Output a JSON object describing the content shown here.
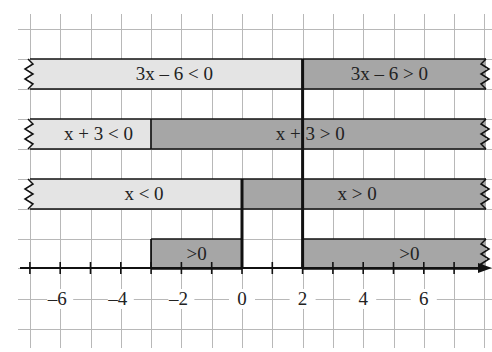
{
  "diagram": {
    "colors": {
      "negative_fill": "#e4e4e4",
      "positive_fill": "#a6a6a6",
      "grid": "#b8b8b8",
      "axis": "#111111",
      "text": "#222222"
    },
    "axis": {
      "tick_labels": [
        "-6",
        "-4",
        "-2",
        "0",
        "2",
        "4",
        "6"
      ],
      "tick_values": [
        -6,
        -4,
        -2,
        0,
        2,
        4,
        6
      ],
      "x_min": -7,
      "x_max": 8,
      "critical_points": [
        -3,
        0,
        2
      ]
    },
    "rows": [
      {
        "id": "factor-3x-6",
        "segments": [
          {
            "from": "-inf",
            "to": 2,
            "sign": "negative",
            "label": "3x – 6 < 0"
          },
          {
            "from": 2,
            "to": "inf",
            "sign": "positive",
            "label": "3x – 6 > 0"
          }
        ]
      },
      {
        "id": "factor-x+3",
        "segments": [
          {
            "from": "-inf",
            "to": -3,
            "sign": "negative",
            "label": "x + 3 < 0"
          },
          {
            "from": -3,
            "to": "inf",
            "sign": "positive",
            "label": "x + 3 > 0"
          }
        ]
      },
      {
        "id": "factor-x",
        "segments": [
          {
            "from": "-inf",
            "to": 0,
            "sign": "negative",
            "label": "x < 0"
          },
          {
            "from": 0,
            "to": "inf",
            "sign": "positive",
            "label": "x > 0"
          }
        ]
      },
      {
        "id": "product",
        "segments": [
          {
            "from": -3,
            "to": 0,
            "sign": "positive",
            "label": ">0"
          },
          {
            "from": 2,
            "to": "inf",
            "sign": "positive",
            "label": ">0"
          }
        ]
      }
    ]
  }
}
